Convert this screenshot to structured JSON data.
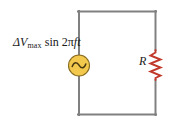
{
  "figure": {
    "background_color": "#ffffff",
    "wire_color": "#808080",
    "source_fill_color": "#f2c94c",
    "source_stroke_color": "#8a6d1f",
    "resistor_color": "#c0392b",
    "text_color": "#1a1a1a"
  },
  "source": {
    "icon": "ac-source-icon",
    "label_prefix": "ΔV",
    "label_subscript": "max",
    "label_function": "sin 2",
    "label_pi": "π",
    "label_freq": "ft",
    "label_full": "ΔVmax sin 2πft"
  },
  "resistor": {
    "icon": "resistor-icon",
    "label": "R"
  },
  "wires": {
    "top": "top-wire",
    "bottom": "bottom-wire",
    "left": "left-wire",
    "right": "right-wire"
  }
}
